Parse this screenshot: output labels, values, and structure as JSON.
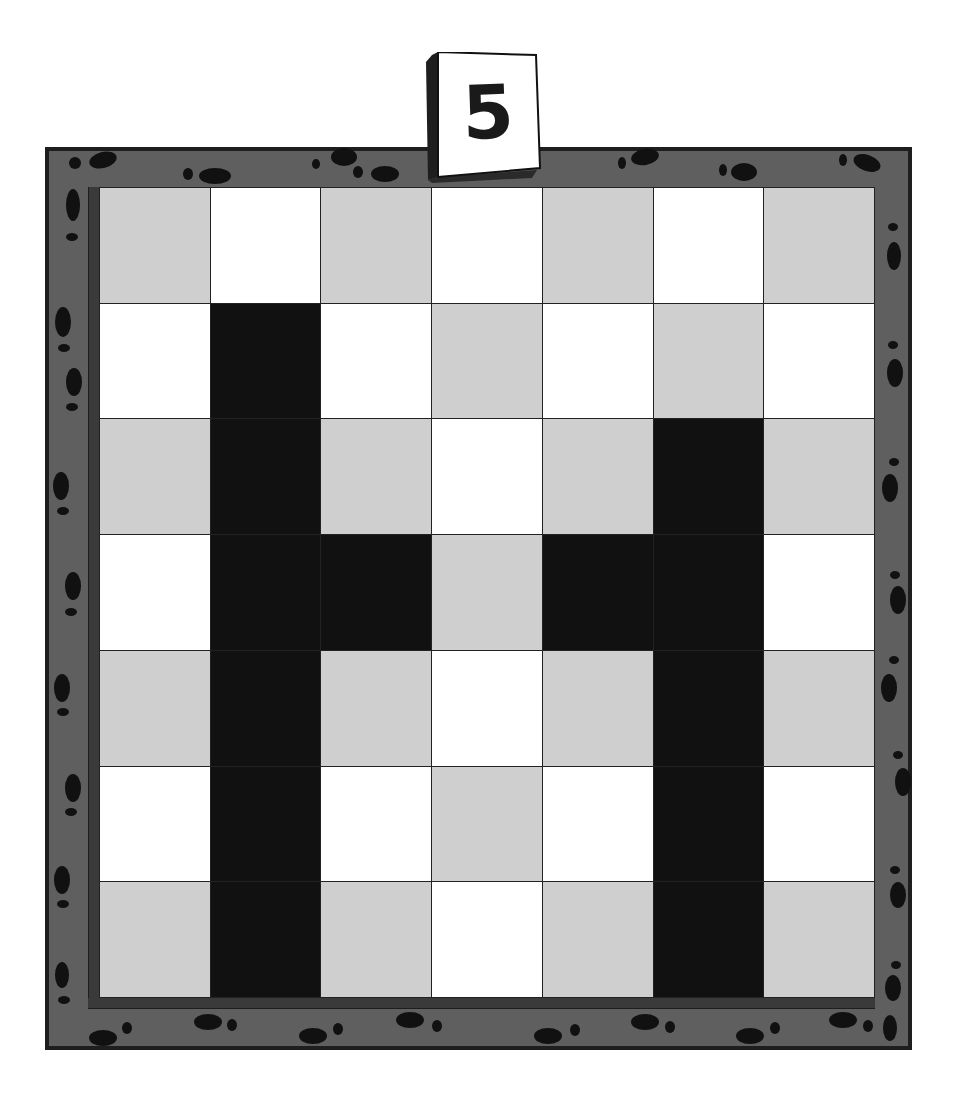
{
  "puzzle": {
    "number_tile": "5",
    "grid": {
      "rows": 7,
      "cols": 7,
      "pattern": "checkerboard",
      "shaded_cells": [
        [
          1,
          1
        ],
        [
          2,
          1
        ],
        [
          3,
          1
        ],
        [
          4,
          1
        ],
        [
          5,
          1
        ],
        [
          6,
          1
        ],
        [
          3,
          2
        ],
        [
          3,
          4
        ],
        [
          2,
          5
        ],
        [
          3,
          5
        ],
        [
          4,
          5
        ],
        [
          5,
          5
        ],
        [
          6,
          5
        ]
      ],
      "shape": "H"
    },
    "colors": {
      "frame": "#5f5f5f",
      "frame_border": "#1e1e1e",
      "gray_cell": "#cfcfcf",
      "white_cell": "#ffffff",
      "shaded_cell": "#111111"
    }
  }
}
